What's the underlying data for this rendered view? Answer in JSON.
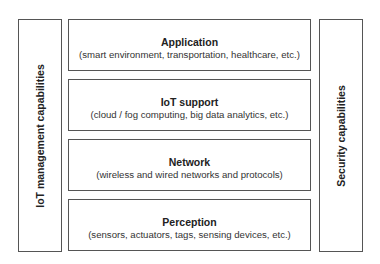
{
  "diagram": {
    "left_panel": {
      "label": "IoT management capabilities"
    },
    "right_panel": {
      "label": "Security capabilities"
    },
    "layers": [
      {
        "title": "Application",
        "subtitle": "(smart environment, transportation, healthcare, etc.)"
      },
      {
        "title": "IoT support",
        "subtitle": "(cloud / fog computing, big data analytics, etc.)"
      },
      {
        "title": "Network",
        "subtitle": "(wireless and wired networks and protocols)"
      },
      {
        "title": "Perception",
        "subtitle": "(sensors, actuators, tags, sensing devices, etc.)"
      }
    ],
    "colors": {
      "border": "#555555",
      "text": "#222222",
      "background": "#ffffff"
    }
  }
}
